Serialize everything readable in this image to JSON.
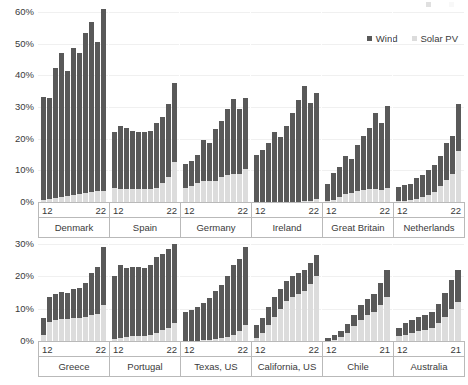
{
  "legend": {
    "faded_label_left": "",
    "faded_label_right": "",
    "items": [
      {
        "label": "Wind",
        "color": "#595959",
        "icon": "square-marker-icon"
      },
      {
        "label": "Solar PV",
        "color": "#dcdcdc",
        "icon": "square-marker-icon"
      }
    ]
  },
  "chart_data": {
    "type": "bar",
    "subtype": "stacked-bar-small-multiples",
    "title": "",
    "xlabel": "",
    "ylabel": "",
    "grid": true,
    "legend_position": "top-right",
    "series_names": [
      "Wind",
      "Solar PV"
    ],
    "series_colors": [
      "#595959",
      "#dcdcdc"
    ],
    "unit": "%",
    "rows": [
      {
        "ylim": [
          0,
          60
        ],
        "yticks": [
          0,
          10,
          20,
          30,
          40,
          50,
          60
        ],
        "ytick_labels": [
          "0%",
          "10%",
          "20%",
          "30%",
          "40%",
          "50%",
          "60%"
        ],
        "panels": [
          {
            "name": "Denmark",
            "x_start": "12",
            "x_end": "22",
            "x": [
              "12",
              "13",
              "14",
              "15",
              "16",
              "17",
              "18",
              "19",
              "20",
              "21",
              "22"
            ],
            "wind": [
              32.5,
              32.0,
              41.0,
              45.5,
              39.5,
              46.5,
              44.5,
              50.5,
              53.5,
              47.0,
              57.5
            ],
            "solar": [
              0.6,
              0.9,
              1.2,
              1.5,
              1.8,
              2.1,
              2.5,
              3.0,
              3.3,
              3.5,
              3.5
            ],
            "totals": [
              33.1,
              32.9,
              42.2,
              47.0,
              41.3,
              48.6,
              47.0,
              53.5,
              56.8,
              50.5,
              61.0
            ]
          },
          {
            "name": "Spain",
            "x_start": "12",
            "x_end": "22",
            "x": [
              "12",
              "13",
              "14",
              "15",
              "16",
              "17",
              "18",
              "19",
              "20",
              "21",
              "22"
            ],
            "wind": [
              17.5,
              20.0,
              19.5,
              18.5,
              18.0,
              18.0,
              18.5,
              20.5,
              21.0,
              23.0,
              25.0
            ],
            "solar": [
              4.5,
              4.0,
              4.0,
              4.0,
              4.0,
              4.0,
              4.0,
              4.5,
              6.0,
              8.0,
              12.5
            ],
            "totals": [
              22.0,
              24.0,
              23.5,
              22.5,
              22.0,
              22.0,
              22.5,
              25.0,
              27.0,
              31.0,
              37.5
            ]
          },
          {
            "name": "Germany",
            "x_start": "12",
            "x_end": "22",
            "x": [
              "12",
              "13",
              "14",
              "15",
              "16",
              "17",
              "18",
              "19",
              "20",
              "21",
              "22"
            ],
            "wind": [
              7.5,
              8.0,
              9.0,
              13.0,
              12.0,
              16.5,
              17.5,
              21.0,
              23.5,
              20.5,
              22.5
            ],
            "solar": [
              4.5,
              5.0,
              6.0,
              6.5,
              6.5,
              6.5,
              8.0,
              8.5,
              9.0,
              9.0,
              10.5
            ],
            "totals": [
              12.0,
              13.0,
              15.0,
              19.5,
              18.5,
              23.0,
              25.5,
              29.5,
              32.5,
              29.5,
              33.0
            ]
          },
          {
            "name": "Ireland",
            "x_start": "12",
            "x_end": "22",
            "x": [
              "12",
              "13",
              "14",
              "15",
              "16",
              "17",
              "18",
              "19",
              "20",
              "21",
              "22"
            ],
            "wind": [
              15.0,
              16.5,
              18.5,
              22.0,
              20.5,
              24.0,
              28.0,
              32.0,
              36.5,
              31.0,
              33.5
            ],
            "solar": [
              0.0,
              0.0,
              0.0,
              0.0,
              0.0,
              0.0,
              0.0,
              0.1,
              0.2,
              0.3,
              0.8
            ],
            "totals": [
              15.0,
              16.5,
              18.5,
              22.0,
              20.5,
              24.0,
              28.0,
              32.1,
              36.7,
              31.3,
              34.3
            ]
          },
          {
            "name": "Great Britain",
            "x_start": "12",
            "x_end": "22",
            "x": [
              "12",
              "13",
              "14",
              "15",
              "16",
              "17",
              "18",
              "19",
              "20",
              "21",
              "22"
            ],
            "wind": [
              5.5,
              8.5,
              9.5,
              12.0,
              10.5,
              14.5,
              17.0,
              19.5,
              24.0,
              21.0,
              26.0
            ],
            "solar": [
              0.3,
              0.7,
              1.5,
              2.5,
              3.0,
              3.5,
              3.8,
              4.0,
              4.2,
              3.8,
              4.3
            ],
            "totals": [
              5.8,
              9.2,
              11.0,
              14.5,
              13.5,
              18.0,
              20.8,
              23.5,
              28.2,
              24.8,
              30.3
            ]
          },
          {
            "name": "Netherlands",
            "x_start": "12",
            "x_end": "22",
            "x": [
              "12",
              "13",
              "14",
              "15",
              "16",
              "17",
              "18",
              "19",
              "20",
              "21",
              "22"
            ],
            "wind": [
              4.5,
              5.0,
              5.0,
              6.5,
              7.0,
              8.0,
              8.5,
              9.5,
              11.5,
              12.0,
              15.0
            ],
            "solar": [
              0.2,
              0.4,
              0.7,
              1.0,
              1.5,
              2.2,
              3.3,
              5.0,
              7.0,
              9.0,
              16.0
            ],
            "totals": [
              4.7,
              5.4,
              5.7,
              7.5,
              8.5,
              10.2,
              11.8,
              14.5,
              18.5,
              21.0,
              31.0
            ]
          }
        ]
      },
      {
        "ylim": [
          0,
          30
        ],
        "yticks": [
          0,
          10,
          20,
          30
        ],
        "ytick_labels": [
          "0%",
          "10%",
          "20%",
          "30%"
        ],
        "panels": [
          {
            "name": "Greece",
            "x_start": "12",
            "x_end": "22",
            "x": [
              "12",
              "13",
              "14",
              "15",
              "16",
              "17",
              "18",
              "19",
              "20",
              "21",
              "22"
            ],
            "wind": [
              5.0,
              7.5,
              8.0,
              8.5,
              8.0,
              9.0,
              9.5,
              10.5,
              13.0,
              14.5,
              18.0
            ],
            "solar": [
              2.0,
              6.0,
              6.5,
              6.8,
              6.8,
              7.0,
              7.0,
              7.5,
              8.0,
              8.5,
              11.0
            ],
            "totals": [
              7.0,
              13.5,
              14.5,
              15.3,
              14.8,
              16.0,
              16.5,
              18.0,
              21.0,
              23.0,
              29.0
            ]
          },
          {
            "name": "Portugal",
            "x_start": "12",
            "x_end": "22",
            "x": [
              "12",
              "13",
              "14",
              "15",
              "16",
              "17",
              "18",
              "19",
              "20",
              "21",
              "22"
            ],
            "wind": [
              19.5,
              22.5,
              21.5,
              21.5,
              21.5,
              21.0,
              21.5,
              23.5,
              23.5,
              24.5,
              24.5
            ],
            "solar": [
              0.7,
              1.0,
              1.2,
              1.4,
              1.5,
              1.7,
              2.0,
              2.5,
              3.5,
              4.0,
              5.5
            ],
            "totals": [
              20.2,
              23.5,
              22.7,
              22.9,
              23.0,
              22.7,
              23.5,
              26.0,
              27.0,
              28.5,
              30.0
            ]
          },
          {
            "name": "Texas, US",
            "x_start": "12",
            "x_end": "22",
            "x": [
              "12",
              "13",
              "14",
              "15",
              "16",
              "17",
              "18",
              "19",
              "20",
              "21",
              "22"
            ],
            "wind": [
              9.0,
              9.5,
              10.5,
              11.5,
              13.0,
              15.0,
              16.5,
              19.0,
              21.5,
              22.5,
              24.0
            ],
            "solar": [
              0.0,
              0.0,
              0.1,
              0.2,
              0.3,
              0.5,
              0.8,
              1.2,
              2.0,
              3.0,
              5.0
            ],
            "totals": [
              9.0,
              9.5,
              10.6,
              11.7,
              13.3,
              15.5,
              17.3,
              20.2,
              23.5,
              25.5,
              29.0
            ]
          },
          {
            "name": "California, US",
            "x_start": "12",
            "x_end": "22",
            "x": [
              "12",
              "13",
              "14",
              "15",
              "16",
              "17",
              "18",
              "19",
              "20",
              "21",
              "22"
            ],
            "wind": [
              4.0,
              4.5,
              5.5,
              6.0,
              6.0,
              6.0,
              6.5,
              6.5,
              6.5,
              6.5,
              6.5
            ],
            "solar": [
              1.0,
              2.5,
              5.0,
              7.5,
              10.0,
              12.5,
              13.5,
              14.5,
              15.5,
              17.5,
              20.0
            ],
            "totals": [
              5.0,
              7.0,
              10.5,
              13.5,
              16.0,
              18.5,
              20.0,
              21.0,
              22.0,
              24.0,
              26.5
            ]
          },
          {
            "name": "Chile",
            "x_start": "12",
            "x_end": "21",
            "x": [
              "12",
              "13",
              "14",
              "15",
              "16",
              "17",
              "18",
              "19",
              "20",
              "21"
            ],
            "wind": [
              1.0,
              1.5,
              2.0,
              2.8,
              3.5,
              4.5,
              5.0,
              5.5,
              7.0,
              8.5
            ],
            "solar": [
              0.0,
              0.3,
              1.2,
              2.5,
              4.5,
              6.5,
              8.0,
              9.0,
              11.0,
              13.5
            ],
            "totals": [
              1.0,
              1.8,
              3.2,
              5.3,
              8.0,
              11.0,
              13.0,
              14.5,
              18.0,
              22.0
            ]
          },
          {
            "name": "Australia",
            "x_start": "12",
            "x_end": "21",
            "x": [
              "12",
              "13",
              "14",
              "15",
              "16",
              "17",
              "18",
              "19",
              "20",
              "21"
            ],
            "wind": [
              2.5,
              3.5,
              4.0,
              4.5,
              4.5,
              5.0,
              6.0,
              7.5,
              9.0,
              10.0
            ],
            "solar": [
              1.5,
              2.0,
              2.5,
              3.0,
              3.5,
              4.0,
              5.5,
              7.5,
              10.0,
              12.0
            ],
            "totals": [
              4.0,
              5.5,
              6.5,
              7.5,
              8.0,
              9.0,
              11.5,
              15.0,
              19.0,
              22.0
            ]
          }
        ]
      }
    ]
  }
}
